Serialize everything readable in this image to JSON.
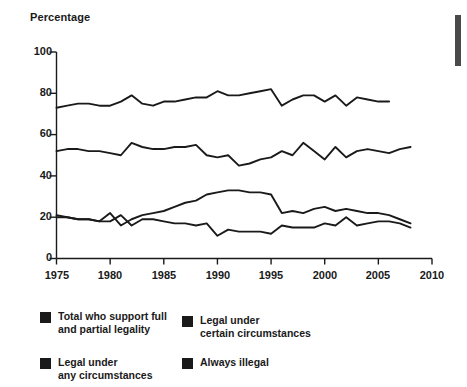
{
  "chart_data": {
    "type": "line",
    "title": "",
    "xlabel": "",
    "ylabel": "Percentage",
    "xlim": [
      1975,
      2010
    ],
    "ylim": [
      0,
      100
    ],
    "xticks": [
      1975,
      1980,
      1985,
      1990,
      1995,
      2000,
      2005,
      2010
    ],
    "yticks": [
      0,
      20,
      40,
      60,
      80,
      100
    ],
    "grid": false,
    "legend_position": "below",
    "series": [
      {
        "name": "Total who support full and partial legality",
        "color": "#1a1a1a",
        "x": [
          1975,
          1976,
          1977,
          1978,
          1979,
          1980,
          1981,
          1982,
          1983,
          1984,
          1985,
          1986,
          1987,
          1988,
          1989,
          1990,
          1991,
          1992,
          1993,
          1994,
          1995,
          1996,
          1997,
          1998,
          1999,
          2000,
          2001,
          2002,
          2003,
          2004,
          2005,
          2006
        ],
        "values": [
          73,
          74,
          75,
          75,
          74,
          74,
          76,
          79,
          75,
          74,
          76,
          76,
          77,
          78,
          78,
          81,
          79,
          79,
          80,
          81,
          82,
          74,
          77,
          79,
          79,
          76,
          79,
          74,
          78,
          77,
          76,
          76
        ]
      },
      {
        "name": "Legal under certain circumstances",
        "color": "#1a1a1a",
        "x": [
          1975,
          1976,
          1977,
          1978,
          1979,
          1980,
          1981,
          1982,
          1983,
          1984,
          1985,
          1986,
          1987,
          1988,
          1989,
          1990,
          1991,
          1992,
          1993,
          1994,
          1995,
          1996,
          1997,
          1998,
          1999,
          2000,
          2001,
          2002,
          2003,
          2004,
          2005,
          2006,
          2007,
          2008
        ],
        "values": [
          52,
          53,
          53,
          52,
          52,
          51,
          50,
          56,
          54,
          53,
          53,
          54,
          54,
          55,
          50,
          49,
          50,
          45,
          46,
          48,
          49,
          52,
          50,
          56,
          52,
          48,
          54,
          49,
          52,
          53,
          52,
          51,
          53,
          54
        ]
      },
      {
        "name": "Legal under any circumstances",
        "color": "#1a1a1a",
        "x": [
          1975,
          1976,
          1977,
          1978,
          1979,
          1980,
          1981,
          1982,
          1983,
          1984,
          1985,
          1986,
          1987,
          1988,
          1989,
          1990,
          1991,
          1992,
          1993,
          1994,
          1995,
          1996,
          1997,
          1998,
          1999,
          2000,
          2001,
          2002,
          2003,
          2004,
          2005,
          2006,
          2007,
          2008
        ],
        "values": [
          21,
          20,
          19,
          19,
          18,
          22,
          16,
          19,
          21,
          22,
          23,
          25,
          27,
          28,
          31,
          32,
          33,
          33,
          32,
          32,
          31,
          22,
          23,
          22,
          24,
          25,
          23,
          24,
          23,
          22,
          22,
          21,
          19,
          17
        ]
      },
      {
        "name": "Always illegal",
        "color": "#1a1a1a",
        "x": [
          1975,
          1976,
          1977,
          1978,
          1979,
          1980,
          1981,
          1982,
          1983,
          1984,
          1985,
          1986,
          1987,
          1988,
          1989,
          1990,
          1991,
          1992,
          1993,
          1994,
          1995,
          1996,
          1997,
          1998,
          1999,
          2000,
          2001,
          2002,
          2003,
          2004,
          2005,
          2006,
          2007,
          2008
        ],
        "values": [
          20,
          20,
          19,
          19,
          18,
          18,
          21,
          16,
          19,
          19,
          18,
          17,
          17,
          16,
          17,
          11,
          14,
          13,
          13,
          13,
          12,
          16,
          15,
          15,
          15,
          17,
          16,
          20,
          16,
          17,
          18,
          18,
          17,
          15
        ]
      }
    ]
  },
  "axis": {
    "y_title": "Percentage",
    "y_ticks": [
      "100",
      "80",
      "60",
      "40",
      "20",
      "0"
    ],
    "x_ticks": [
      "1975",
      "1980",
      "1985",
      "1990",
      "1995",
      "2000",
      "2005",
      "2010"
    ]
  },
  "legend": {
    "items": [
      {
        "label": "Total who support full\nand partial legality",
        "swatch": "#1a1a1a"
      },
      {
        "label": "Legal under\ncertain circumstances",
        "swatch": "#1a1a1a"
      },
      {
        "label": "Legal under\nany circumstances",
        "swatch": "#1a1a1a"
      },
      {
        "label": "Always illegal",
        "swatch": "#1a1a1a"
      }
    ]
  }
}
